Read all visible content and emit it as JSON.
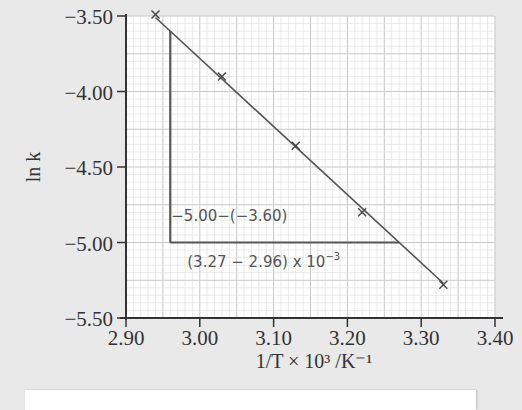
{
  "chart_data": {
    "type": "scatter",
    "title": "",
    "xlabel": "1/T × 10³ /K⁻¹",
    "ylabel": "ln k",
    "xlim": [
      2.9,
      3.4
    ],
    "ylim": [
      -5.5,
      -3.5
    ],
    "x_ticks": [
      "2.90",
      "3.00",
      "3.10",
      "3.20",
      "3.30",
      "3.40"
    ],
    "y_ticks": [
      "−3.50",
      "−4.00",
      "−4.50",
      "−5.00",
      "−5.50"
    ],
    "x_tick_values": [
      2.9,
      3.0,
      3.1,
      3.2,
      3.3,
      3.4
    ],
    "y_tick_values": [
      -3.5,
      -4.0,
      -4.5,
      -5.0,
      -5.5
    ],
    "grid": true,
    "series": [
      {
        "name": "data points",
        "marker": "x",
        "x": [
          2.94,
          3.03,
          3.13,
          3.22,
          3.33
        ],
        "y": [
          -3.49,
          -3.9,
          -4.36,
          -4.8,
          -5.28
        ]
      }
    ],
    "fit_line": {
      "x": [
        2.94,
        3.33
      ],
      "y": [
        -3.51,
        -5.27
      ]
    },
    "slope_triangle": {
      "x1": 2.96,
      "x2": 3.27,
      "y1": -3.6,
      "y2": -5.0,
      "rise_label": "−5.00−(−3.60)",
      "run_label": "(3.27 − 2.96) x 10",
      "run_label_exponent": "−3"
    },
    "colors": {
      "axis": "#333333",
      "grid_minor": "#dcdcdc",
      "grid_major": "#c8c8c8",
      "line": "#555555",
      "plot_bg": "#ffffff",
      "page_bg": "#e9e9e9"
    }
  }
}
